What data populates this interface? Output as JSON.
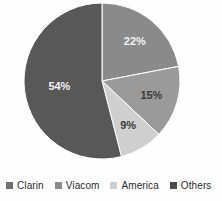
{
  "chart_data": {
    "type": "pie",
    "title": "",
    "subtitle": "",
    "xlabel": "",
    "ylabel": "",
    "legend_position": "bottom",
    "grid": false,
    "start_angle_deg": 0,
    "direction": "clockwise",
    "categories": [
      "Clarin",
      "Viacom",
      "America",
      "Others"
    ],
    "values": [
      15,
      22,
      9,
      54
    ],
    "slices": [
      {
        "name": "Viacom",
        "value": 22,
        "data_label": "22%",
        "color": "#8a8a8a",
        "label_color": "light",
        "start_deg": 0,
        "end_deg": 79.2
      },
      {
        "name": "Clarin",
        "value": 15,
        "data_label": "15%",
        "color": "#9a9a9a",
        "label_color": "dark",
        "start_deg": 79.2,
        "end_deg": 133.2
      },
      {
        "name": "America",
        "value": 9,
        "data_label": "9%",
        "color": "#cfcfcf",
        "label_color": "dark",
        "start_deg": 133.2,
        "end_deg": 165.6
      },
      {
        "name": "Others",
        "value": 54,
        "data_label": "54%",
        "color": "#585858",
        "label_color": "light",
        "start_deg": 165.6,
        "end_deg": 360
      }
    ],
    "data_labels": [
      "22%",
      "15%",
      "9%",
      "54%"
    ]
  },
  "legend": {
    "items": [
      {
        "label": "Clarin",
        "color": "#6f6f6f",
        "swatch_icon": "square-swatch-icon"
      },
      {
        "label": "Viacom",
        "color": "#8a8a8a",
        "swatch_icon": "square-swatch-icon"
      },
      {
        "label": "America",
        "color": "#cfcfcf",
        "swatch_icon": "square-swatch-icon"
      },
      {
        "label": "Others",
        "color": "#4a4a4a",
        "swatch_icon": "square-swatch-icon"
      }
    ]
  },
  "geometry": {
    "center_x": 102,
    "center_y": 81,
    "radius": 78
  }
}
